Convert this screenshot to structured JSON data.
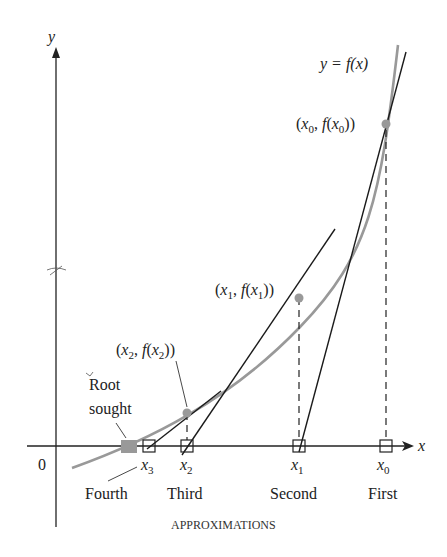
{
  "diagram": {
    "axes": {
      "y_label": "y",
      "x_label": "x",
      "origin_label": "0"
    },
    "curve": {
      "label": "y = f(x)",
      "color": "#999999"
    },
    "tangent_color": "#1a1a1a",
    "points": [
      {
        "label": "(x0, f(x0))",
        "name": "x0"
      },
      {
        "label": "(x1, f(x1))",
        "name": "x1"
      },
      {
        "label": "(x2, f(x2))",
        "name": "x2"
      }
    ],
    "root_label_line1": "Root",
    "root_label_line2": "sought",
    "x_ticks": [
      {
        "sym": "x",
        "sub": "3",
        "order": "Fourth"
      },
      {
        "sym": "x",
        "sub": "2",
        "order": "Third"
      },
      {
        "sym": "x",
        "sub": "1",
        "order": "Second"
      },
      {
        "sym": "x",
        "sub": "0",
        "order": "First"
      }
    ],
    "caption": "APPROXIMATIONS",
    "point_color": "#999999",
    "root_color": "#999999"
  }
}
